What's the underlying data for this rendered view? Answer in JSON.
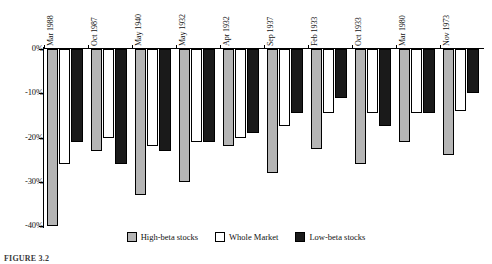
{
  "chart_data": {
    "type": "bar",
    "title": "",
    "subtitle": "",
    "xlabel": "",
    "ylabel": "",
    "grid": false,
    "legend_position": "bottom-center",
    "ylim": [
      -40,
      0
    ],
    "yticks": [
      "0%",
      "-10%",
      "-20%",
      "-30%",
      "-40%"
    ],
    "ytick_values": [
      0,
      -10,
      -20,
      -30,
      -40
    ],
    "categories": [
      "Mar 1988",
      "Oct 1987",
      "May 1940",
      "May 1932",
      "Apr 1932",
      "Sep 1937",
      "Feb 1933",
      "Oct 1933",
      "Mar 1980",
      "Nov 1973"
    ],
    "series": [
      {
        "name": "High-beta stocks",
        "color": "#b5b5b5",
        "values": [
          -40.0,
          -23.0,
          -33.0,
          -30.0,
          -22.0,
          -28.0,
          -22.5,
          -26.0,
          -21.0,
          -24.0
        ]
      },
      {
        "name": "Whole Market",
        "color": "#ffffff",
        "values": [
          -26.0,
          -20.0,
          -22.0,
          -21.0,
          -20.0,
          -17.5,
          -14.5,
          -14.5,
          -14.5,
          -14.0
        ]
      },
      {
        "name": "Low-beta stocks",
        "color": "#1a1a1a",
        "values": [
          -21.0,
          -26.0,
          -23.0,
          -21.0,
          -19.0,
          -14.5,
          -11.0,
          -17.5,
          -14.5,
          -10.0
        ]
      }
    ]
  },
  "legend": {
    "items": [
      {
        "label": "High-beta stocks",
        "swatch": "high-beta-swatch"
      },
      {
        "label": "Whole Market",
        "swatch": "whole-market-swatch"
      },
      {
        "label": "Low-beta stocks",
        "swatch": "low-beta-swatch"
      }
    ]
  },
  "caption": {
    "text": "FIGURE 3.2"
  }
}
